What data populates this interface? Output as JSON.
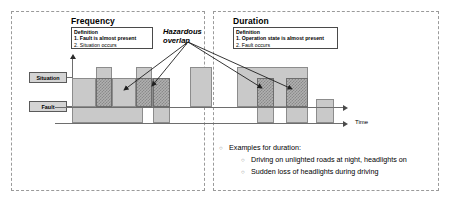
{
  "left_panel": {
    "title": "Frequency",
    "definition": {
      "header": "Definition",
      "item1": "1.  Fault is almost present",
      "item2": "2.  Situation occurs"
    },
    "axis_labels": {
      "situation": "Situation",
      "fault": "Fault"
    }
  },
  "right_panel": {
    "title": "Duration",
    "definition": {
      "header": "Definition",
      "item1": "1.  Operation state is almost present",
      "item2": "2.  Fault occurs"
    }
  },
  "hazard": {
    "line1": "Hazardous",
    "line2": "overlap"
  },
  "time_axis": {
    "label": "Time"
  },
  "examples": {
    "bullet_glyph": "○",
    "heading": "Examples for duration:",
    "items": [
      "Driving on unlighted roads at night, headlights on",
      "Sudden loss of headlights during driving"
    ]
  },
  "colors": {
    "bar_fill": "#c9c9c9",
    "bar_stroke": "#8c8c8c",
    "overlap_fill": "#8a8a8a",
    "panel_border": "#9a9a9a",
    "axis": "#6e6e6e",
    "label_fill": "#d4d4d4"
  },
  "chart_data": {
    "type": "bar",
    "xlabel": "Time",
    "ylabel": "",
    "grid": false,
    "legend_position": "left",
    "rows": [
      "Situation",
      "Fault"
    ],
    "situation_intervals": [
      {
        "x": 72,
        "w": 24,
        "top": 78,
        "height": 29
      },
      {
        "x": 96,
        "w": 16,
        "top": 67,
        "height": 40
      },
      {
        "x": 112,
        "w": 24,
        "top": 78,
        "height": 29
      },
      {
        "x": 136,
        "w": 16,
        "top": 67,
        "height": 40
      },
      {
        "x": 152,
        "w": 18,
        "top": 78,
        "height": 29
      },
      {
        "x": 190,
        "w": 22,
        "top": 67,
        "height": 40
      },
      {
        "x": 237,
        "w": 71,
        "top": 67,
        "height": 40
      }
    ],
    "fault_intervals": [
      {
        "x": 72,
        "w": 71,
        "top": 99,
        "height": 24
      },
      {
        "x": 153,
        "w": 17,
        "top": 99,
        "height": 24
      },
      {
        "x": 257,
        "w": 17,
        "top": 99,
        "height": 24
      },
      {
        "x": 286,
        "w": 22,
        "top": 99,
        "height": 24
      },
      {
        "x": 316,
        "w": 18,
        "top": 99,
        "height": 24
      }
    ],
    "overlap_intervals": [
      {
        "x": 96,
        "w": 16,
        "top": 78,
        "height": 29
      },
      {
        "x": 136,
        "w": 16,
        "top": 78,
        "height": 29
      },
      {
        "x": 153,
        "w": 17,
        "top": 78,
        "height": 29
      },
      {
        "x": 257,
        "w": 17,
        "top": 78,
        "height": 29
      },
      {
        "x": 286,
        "w": 22,
        "top": 78,
        "height": 29
      }
    ],
    "hazard_arrow_targets": [
      [
        124,
        90
      ],
      [
        152,
        86
      ],
      [
        262,
        88
      ],
      [
        292,
        89
      ]
    ]
  }
}
